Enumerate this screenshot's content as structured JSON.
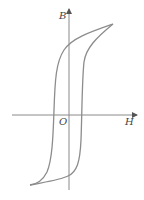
{
  "diagram": {
    "type": "hysteresis-loop",
    "axes": {
      "y_label": "B",
      "x_label": "H",
      "origin_label": "O"
    },
    "colors": {
      "axis": "#8a8a8a",
      "curve": "#8c8c8c",
      "label": "#444444"
    },
    "key_points": {
      "positive_saturation": [
        113,
        24
      ],
      "negative_saturation": [
        30,
        185
      ],
      "left_branch_h_crossing": [
        54,
        115
      ],
      "right_branch_h_crossing": [
        82,
        115
      ]
    }
  }
}
